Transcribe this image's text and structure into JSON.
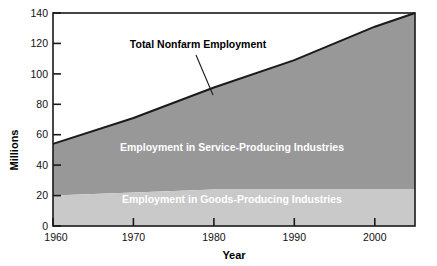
{
  "chart_data": {
    "type": "area",
    "title": "",
    "xlabel": "Year",
    "ylabel": "Millions",
    "xlim": [
      1960,
      2005
    ],
    "ylim": [
      0,
      140
    ],
    "xticks": [
      1960,
      1970,
      1980,
      1990,
      2000
    ],
    "yticks": [
      0,
      20,
      40,
      60,
      80,
      100,
      120,
      140
    ],
    "grid": false,
    "legend_position": "inline-labels",
    "x": [
      1960,
      1970,
      1980,
      1990,
      2000,
      2005
    ],
    "series": [
      {
        "name": "Employment in Goods-Producing Industries",
        "values": [
          20,
          22,
          24,
          24,
          24,
          24
        ],
        "color": "#c9c9c9",
        "stacked": true
      },
      {
        "name": "Employment in Service-Producing Industries",
        "values": [
          34,
          49,
          67,
          85,
          107,
          116
        ],
        "color": "#989898",
        "stacked": true
      }
    ],
    "totals": {
      "name": "Total Nonfarm Employment",
      "values": [
        54,
        71,
        91,
        109,
        131,
        140
      ]
    },
    "annotations": [
      {
        "text": "Total Nonfarm Employment",
        "x": 1972,
        "y": 124,
        "leader_to_x": 1980,
        "leader_to_y": 91
      }
    ]
  },
  "axes": {
    "y_title": "Millions",
    "x_title": "Year",
    "y_tick_labels": [
      "0",
      "20",
      "40",
      "60",
      "80",
      "100",
      "120",
      "140"
    ],
    "x_tick_labels": [
      "1960",
      "1970",
      "1980",
      "1990",
      "2000"
    ]
  },
  "labels": {
    "service_area": "Employment in Service-Producing Industries",
    "goods_area": "Employment in Goods-Producing Industries",
    "total_line": "Total Nonfarm Employment"
  },
  "colors": {
    "goods_fill": "#c9c9c9",
    "service_fill": "#989898",
    "axis": "#1a1a1a",
    "total_line": "#1a1a1a",
    "background": "#ffffff",
    "label_text": "#ffffff",
    "tick_text": "#111111"
  }
}
